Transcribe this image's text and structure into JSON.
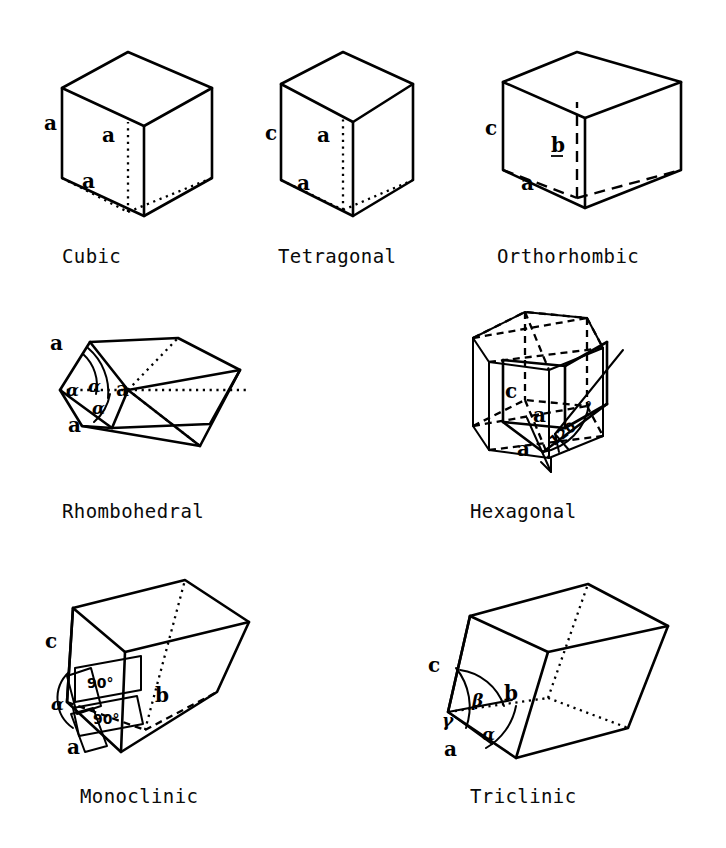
{
  "figure": {
    "background_color": "#ffffff",
    "line_color": "#000000"
  },
  "systems": [
    {
      "id": "cubic",
      "caption": "Cubic",
      "edge_labels": [
        "a",
        "a",
        "a"
      ],
      "angle_labels": [],
      "hidden_line_style": "dotted"
    },
    {
      "id": "tetragonal",
      "caption": "Tetragonal",
      "edge_labels": [
        "c",
        "a",
        "a"
      ],
      "angle_labels": [],
      "hidden_line_style": "dotted"
    },
    {
      "id": "orthorhombic",
      "caption": "Orthorhombic",
      "edge_labels": [
        "c",
        "b",
        "a"
      ],
      "angle_labels": [],
      "hidden_line_style": "dashed-long"
    },
    {
      "id": "rhombohedral",
      "caption": "Rhombohedral",
      "edge_labels": [
        "a",
        "a",
        "a"
      ],
      "angle_labels": [
        "α",
        "α",
        "α"
      ],
      "hidden_line_style": "dotted"
    },
    {
      "id": "hexagonal",
      "caption": "Hexagonal",
      "edge_labels": [
        "c",
        "a",
        "a"
      ],
      "angle_labels": [
        "120"
      ],
      "angle_degree_symbol": "°",
      "hidden_line_style": "dashed-mid"
    },
    {
      "id": "monoclinic",
      "caption": "Monoclinic",
      "edge_labels": [
        "c",
        "b",
        "a"
      ],
      "angle_labels": [
        "90°",
        "90°",
        "α"
      ],
      "hidden_line_style": "dotted"
    },
    {
      "id": "triclinic",
      "caption": "Triclinic",
      "edge_labels": [
        "c",
        "b",
        "a"
      ],
      "angle_labels": [
        "β",
        "γ",
        "α"
      ],
      "hidden_line_style": "dotted"
    }
  ],
  "glyphs": {
    "a": "a",
    "b": "b",
    "c": "c",
    "alpha": "α",
    "beta": "β",
    "gamma": "γ",
    "ninety_deg": "90°",
    "one_twenty": "120",
    "degree": "°"
  }
}
